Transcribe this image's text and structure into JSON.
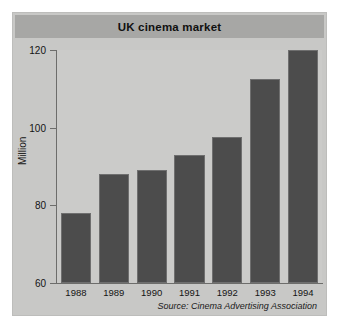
{
  "figure": {
    "title": "UK cinema market",
    "source_note": "Source: Cinema Advertising Association"
  },
  "colors": {
    "panel_background": "#c8c8c6",
    "title_band": "#a7a7a5",
    "plot_background": "#cbcbc9",
    "bar_fill": "#4c4c4c",
    "bar_edge": "#6f6f6f",
    "axis_line": "#6d6d6b",
    "text": "#141414"
  },
  "chart_data": {
    "type": "bar",
    "title": "UK cinema market",
    "xlabel": "",
    "ylabel": "Million",
    "categories": [
      "1988",
      "1989",
      "1990",
      "1991",
      "1992",
      "1993",
      "1994"
    ],
    "values": [
      78,
      88,
      89,
      93,
      97.5,
      112.5,
      120
    ],
    "ylim": [
      60,
      120
    ],
    "yticks": [
      60,
      80,
      100,
      120
    ],
    "ytick_labels": [
      "60",
      "80",
      "100",
      "120"
    ],
    "grid": false,
    "legend": null,
    "annotations": [
      "Source: Cinema Advertising Association"
    ]
  }
}
